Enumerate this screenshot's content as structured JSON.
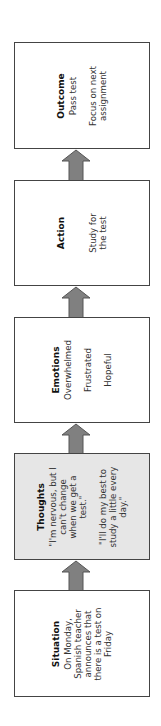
{
  "diagram": {
    "orientation": "rotated-90-ccw",
    "colors": {
      "border": "#444444",
      "arrow_fill": "#808080",
      "arrow_stroke": "#555555",
      "shaded_box": "#e6e6e6",
      "box": "#ffffff"
    },
    "steps": [
      {
        "title": "Situation",
        "lines": [
          "On Monday,",
          "Spanish teacher",
          "announces that",
          "there is a test on",
          "Friday"
        ]
      },
      {
        "title": "Thoughts",
        "lines": [
          "\"I'm nervous, but I",
          "can't change",
          "when we get a",
          "test.\"",
          "",
          "\"I'll do my best to",
          "study a little every",
          "day.\""
        ]
      },
      {
        "title": "Emotions",
        "lines": [
          "Overwhelmed",
          "",
          "Frustrated",
          "",
          "Hopeful"
        ]
      },
      {
        "title": "Action",
        "lines": [
          "",
          "",
          "Study for",
          "the test"
        ]
      },
      {
        "title": "Outcome",
        "lines": [
          "Pass test",
          "",
          "Focus on next",
          "assignment"
        ]
      }
    ]
  }
}
